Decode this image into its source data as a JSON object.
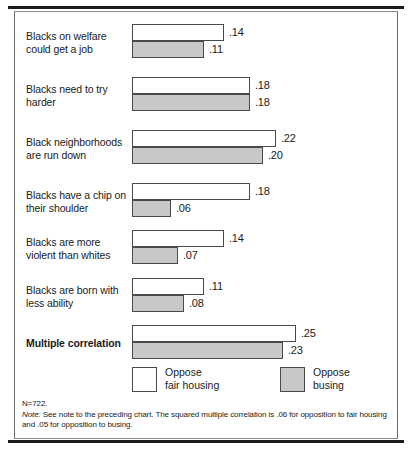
{
  "chart_data": {
    "type": "bar",
    "orientation": "horizontal",
    "title": "",
    "xlabel": "",
    "ylabel": "",
    "xlim": [
      0,
      0.25
    ],
    "grid": false,
    "legend_position": "bottom",
    "categories": [
      "Blacks on welfare could get a job",
      "Blacks need to try harder",
      "Black neighborhoods are run down",
      "Blacks have a chip on their shoulder",
      "Blacks are more violent than whites",
      "Blacks are born with less ability",
      "Multiple correlation"
    ],
    "series": [
      {
        "name": "Oppose fair housing",
        "color": "#ffffff",
        "values": [
          0.14,
          0.18,
          0.22,
          0.18,
          0.14,
          0.11,
          0.25
        ],
        "labels": [
          ".14",
          ".18",
          ".22",
          ".18",
          ".14",
          ".11",
          ".25"
        ]
      },
      {
        "name": "Oppose busing",
        "color": "#c8c8c8",
        "values": [
          0.11,
          0.18,
          0.2,
          0.06,
          0.07,
          0.08,
          0.23
        ],
        "labels": [
          ".11",
          ".18",
          ".20",
          ".06",
          ".07",
          ".08",
          ".23"
        ]
      }
    ]
  },
  "rows": [
    {
      "label_line1": "Blacks on welfare",
      "label_line2": "could get a job",
      "bold": false,
      "top_value": ".14",
      "bottom_value": ".11"
    },
    {
      "label_line1": "Blacks need to try",
      "label_line2": "harder",
      "bold": false,
      "top_value": ".18",
      "bottom_value": ".18"
    },
    {
      "label_line1": "Black neighborhoods",
      "label_line2": "are run down",
      "bold": false,
      "top_value": ".22",
      "bottom_value": ".20"
    },
    {
      "label_line1": "Blacks have a chip on",
      "label_line2": "their shoulder",
      "bold": false,
      "top_value": ".18",
      "bottom_value": ".06"
    },
    {
      "label_line1": "Blacks are more",
      "label_line2": "violent than whites",
      "bold": false,
      "top_value": ".14",
      "bottom_value": ".07"
    },
    {
      "label_line1": "Blacks are born with",
      "label_line2": "less ability",
      "bold": false,
      "top_value": ".11",
      "bottom_value": ".08"
    },
    {
      "label_line1": "Multiple correlation",
      "label_line2": "",
      "bold": true,
      "top_value": ".25",
      "bottom_value": ".23"
    }
  ],
  "legend": {
    "items": [
      {
        "label_line1": "Oppose",
        "label_line2": "fair housing",
        "swatch": "white"
      },
      {
        "label_line1": "Oppose",
        "label_line2": "busing",
        "swatch": "gray"
      }
    ]
  },
  "footnote": {
    "n": "N=722.",
    "note_label": "Note:",
    "note_text": " See note to the preceding chart. The squared multiple correlation is .06 for opposition to fair housing and .05 for opposition to busing."
  }
}
